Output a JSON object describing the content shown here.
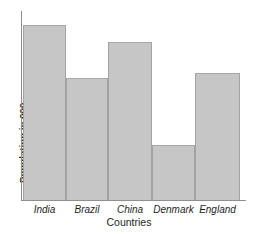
{
  "chart_data": {
    "type": "bar",
    "title": "",
    "xlabel": "Countries",
    "ylabel": "Population in 000",
    "categories": [
      "India",
      "Brazil",
      "China",
      "Denmark",
      "England"
    ],
    "values": [
      100,
      70,
      90,
      32,
      73
    ],
    "ylim": [
      0,
      108
    ],
    "grid": false,
    "legend": false,
    "bar_color": "#c6c6c6",
    "bar_edge_color": "#a2a2a2",
    "axis_color": "#8f8f8f",
    "category_label_style": "italic",
    "axis_tick_labels": []
  },
  "axes": {
    "x_title": "Countries",
    "y_title": "Population in 000"
  },
  "bars": [
    {
      "label": "India",
      "value": 100,
      "top_px": 25,
      "left_px": 23,
      "width_px": 43
    },
    {
      "label": "Brazil",
      "value": 70,
      "top_px": 78,
      "left_px": 66,
      "width_px": 42
    },
    {
      "label": "China",
      "value": 90,
      "top_px": 42,
      "left_px": 108,
      "width_px": 44
    },
    {
      "label": "Denmark",
      "value": 32,
      "top_px": 145,
      "left_px": 152,
      "width_px": 43
    },
    {
      "label": "England",
      "value": 73,
      "top_px": 73,
      "left_px": 195,
      "width_px": 45
    }
  ],
  "geometry": {
    "baseline_px": 200,
    "y_axis_x_px": 21,
    "y_axis_top_px": 11,
    "x_axis_width_px": 225
  }
}
